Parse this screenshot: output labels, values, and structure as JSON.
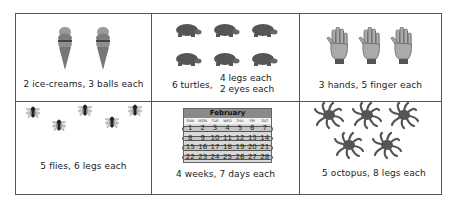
{
  "cells": [
    {
      "id": "ice-creams",
      "caption": "2 ice-creams, 3 balls each",
      "count": 2,
      "icon": "ice-cream-icon"
    },
    {
      "id": "turtles",
      "caption_main": "6 turtles,",
      "caption_line1": "4 legs each",
      "caption_line2": "2 eyes each",
      "count": 6,
      "icon": "turtle-icon"
    },
    {
      "id": "hands",
      "caption": "3 hands, 5 finger each",
      "count": 3,
      "icon": "hand-icon"
    },
    {
      "id": "flies",
      "caption": "5 flies, 6 legs each",
      "count": 5,
      "icon": "fly-icon"
    },
    {
      "id": "weeks",
      "caption": "4 weeks, 7 days each",
      "icon": "calendar-icon",
      "calendar": {
        "month": "February",
        "days": [
          "SUN",
          "MON",
          "TUE",
          "WED",
          "THU",
          "FRI",
          "SAT"
        ],
        "weeks": [
          [
            "1",
            "2",
            "3",
            "4",
            "5",
            "6",
            "7"
          ],
          [
            "8",
            "9",
            "10",
            "11",
            "12",
            "13",
            "14"
          ],
          [
            "15",
            "16",
            "17",
            "18",
            "19",
            "20",
            "21"
          ],
          [
            "22",
            "23",
            "24",
            "25",
            "26",
            "27",
            "28"
          ]
        ]
      }
    },
    {
      "id": "octopus",
      "caption": "5 octopus, 8 legs each",
      "count": 5,
      "icon": "octopus-icon"
    }
  ]
}
